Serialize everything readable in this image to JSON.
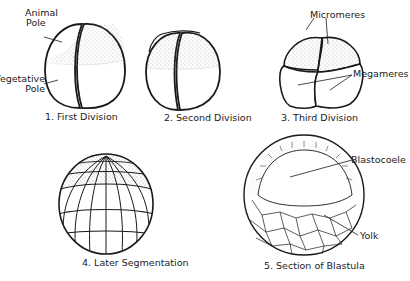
{
  "diagram": {
    "panels": [
      {
        "id": 1,
        "caption": "1. First Division",
        "labels": [
          "Animal Pole",
          "Vegetative Pole"
        ]
      },
      {
        "id": 2,
        "caption": "2. Second Division",
        "labels": []
      },
      {
        "id": 3,
        "caption": "3. Third Division",
        "labels": [
          "Micromeres",
          "Megameres"
        ]
      },
      {
        "id": 4,
        "caption": "4. Later Segmentation",
        "labels": []
      },
      {
        "id": 5,
        "caption": "5. Section of Blastula",
        "labels": [
          "Blastocoele",
          "Yolk"
        ]
      }
    ],
    "labels": {
      "animal_pole_1": "Animal",
      "animal_pole_2": "Pole",
      "vegetative_pole_1": "Vegetative",
      "vegetative_pole_2": "Pole",
      "micromeres": "Micromeres",
      "megameres": "Megameres",
      "blastocoele": "Blastocoele",
      "yolk": "Yolk"
    },
    "colors": {
      "ink": "#1a1a1a",
      "stipple": "#555555",
      "background": "#ffffff"
    }
  }
}
